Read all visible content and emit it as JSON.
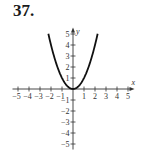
{
  "problem": {
    "number": "37."
  },
  "colors": {
    "axis": "#333333",
    "curve": "#111111",
    "text": "#333333"
  },
  "chart_data": {
    "type": "line",
    "title": "",
    "function": "y = x^2",
    "xlabel": "x",
    "ylabel": "y",
    "xlim": [
      -5.5,
      5.5
    ],
    "ylim": [
      -5.5,
      5.5
    ],
    "grid": false,
    "legend": null,
    "x_tick_labels": [
      "-5",
      "-4",
      "-3",
      "-2",
      "-1",
      "1",
      "2",
      "3",
      "4",
      "5"
    ],
    "y_tick_labels": [
      "5",
      "4",
      "3",
      "2",
      "1",
      "-1",
      "-2",
      "-3",
      "-4",
      "-5"
    ],
    "series": [
      {
        "name": "y = x^2",
        "x": [
          -2.24,
          -2,
          -1.5,
          -1,
          -0.5,
          0,
          0.5,
          1,
          1.5,
          2,
          2.24
        ],
        "y": [
          5.0,
          4,
          2.25,
          1,
          0.25,
          0,
          0.25,
          1,
          2.25,
          4,
          5.0
        ]
      }
    ]
  }
}
